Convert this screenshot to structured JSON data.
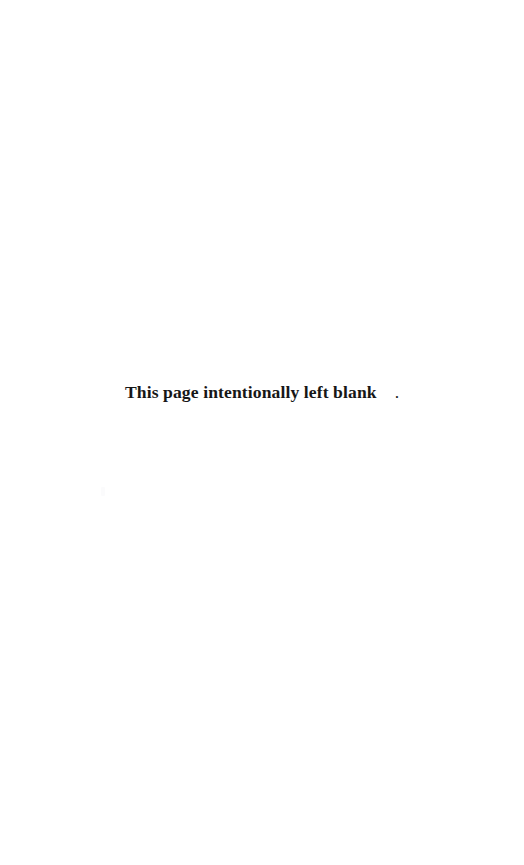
{
  "page": {
    "width": 524,
    "height": 865,
    "background_color": "#ffffff",
    "text_color": "#171717"
  },
  "notice": {
    "full_text": "This page intentionally left blank.",
    "sentence": "This page intentionally left blank",
    "terminal_punctuation": "."
  },
  "artifacts": {
    "scan_speck_color": "#fbfbfc"
  }
}
